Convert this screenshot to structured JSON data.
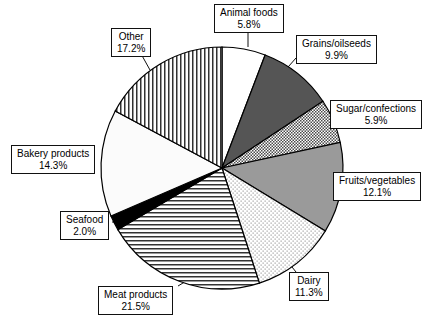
{
  "chart_data": {
    "type": "pie",
    "title": "",
    "subtitle": "",
    "xlabel": "",
    "ylabel": "",
    "legend_position": "callout-labels",
    "grid": false,
    "units": "percent",
    "start_angle_deg": 0,
    "direction": "clockwise",
    "categories": [
      "Animal foods",
      "Grains/oilseeds",
      "Sugar/confections",
      "Fruits/vegetables",
      "Dairy",
      "Meat products",
      "Seafood",
      "Bakery products",
      "Other"
    ],
    "values": [
      5.8,
      9.9,
      5.9,
      12.1,
      11.3,
      21.5,
      2.0,
      14.3,
      17.2
    ],
    "slices": [
      {
        "label": "Animal foods",
        "value": 5.8,
        "value_text": "5.8%",
        "fill": "solid-white",
        "color": "#ffffff",
        "label_x": 214,
        "label_y": 4,
        "leader": [
          [
            248,
            31
          ],
          [
            248,
            47
          ]
        ]
      },
      {
        "label": "Grains/oilseeds",
        "value": 9.9,
        "value_text": "9.9%",
        "fill": "solid-dark-gray",
        "color": "#555555",
        "label_x": 296,
        "label_y": 35,
        "leader": [
          [
            296,
            58
          ],
          [
            281,
            75
          ]
        ]
      },
      {
        "label": "Sugar/confections",
        "value": 5.9,
        "value_text": "5.9%",
        "fill": "checker",
        "color": "#d6d6d6",
        "label_x": 330,
        "label_y": 100,
        "leader": [
          [
            330,
            113
          ],
          [
            312,
            113
          ]
        ]
      },
      {
        "label": "Fruits/vegetables",
        "value": 12.1,
        "value_text": "12.1%",
        "fill": "solid-mid-gray",
        "color": "#9a9a9a",
        "label_x": 333,
        "label_y": 172,
        "leader": [
          [
            333,
            184
          ],
          [
            320,
            184
          ]
        ]
      },
      {
        "label": "Dairy",
        "value": 11.3,
        "value_text": "11.3%",
        "fill": "fine-dots",
        "color": "#f2f2f2",
        "label_x": 289,
        "label_y": 272,
        "leader": [
          [
            296,
            272
          ],
          [
            288,
            262
          ]
        ]
      },
      {
        "label": "Meat products",
        "value": 21.5,
        "value_text": "21.5%",
        "fill": "horizontal-lines",
        "color": "#e8e8e8",
        "label_x": 98,
        "label_y": 286,
        "leader": [
          [
            178,
            286
          ],
          [
            193,
            277
          ]
        ]
      },
      {
        "label": "Seafood",
        "value": 2.0,
        "value_text": "2.0%",
        "fill": "solid-black",
        "color": "#000000",
        "label_x": 60,
        "label_y": 211,
        "leader": [
          [
            112,
            222
          ],
          [
            128,
            222
          ]
        ]
      },
      {
        "label": "Bakery products",
        "value": 14.3,
        "value_text": "14.3%",
        "fill": "solid-near-white",
        "color": "#fbfbfb",
        "label_x": 11,
        "label_y": 145,
        "leader": [
          [
            106,
            158
          ],
          [
            118,
            158
          ]
        ]
      },
      {
        "label": "Other",
        "value": 17.2,
        "value_text": "17.2%",
        "fill": "vertical-lines",
        "color": "#eeeeee",
        "label_x": 111,
        "label_y": 28,
        "leader": [
          [
            140,
            52
          ],
          [
            150,
            70
          ]
        ]
      }
    ],
    "geometry": {
      "center_x": 222,
      "center_y": 168,
      "radius": 121
    },
    "stroke_color": "#000000"
  }
}
